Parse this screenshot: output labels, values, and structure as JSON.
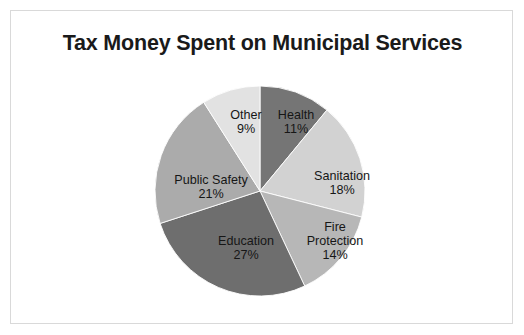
{
  "slide": {
    "background_color": "#ffffff",
    "border_color": "#d9d9d9"
  },
  "chart_data": {
    "type": "pie",
    "title": "Tax Money Spent on Municipal Services",
    "xlabel": "",
    "ylabel": "",
    "legend_position": "none",
    "grid": false,
    "units": "percent",
    "total": 100,
    "start_angle_deg": 0,
    "direction": "clockwise",
    "categories": [
      "Health",
      "Sanitation",
      "Fire Protection",
      "Education",
      "Public Safety",
      "Other"
    ],
    "values": [
      11,
      18,
      14,
      27,
      21,
      9
    ],
    "value_labels": [
      "11%",
      "18%",
      "14%",
      "27%",
      "21%",
      "9%"
    ],
    "colors": [
      "#757575",
      "#d2d2d2",
      "#b7b7b7",
      "#6e6e6e",
      "#ababab",
      "#e2e2e2"
    ],
    "slices": [
      {
        "name": "Health",
        "label_lines": [
          "Health",
          "11%"
        ],
        "value": 11,
        "value_label": "11%",
        "color": "#757575",
        "label_x": 285,
        "label_y": 111
      },
      {
        "name": "Sanitation",
        "label_lines": [
          "Sanitation",
          "18%"
        ],
        "value": 18,
        "value_label": "18%",
        "color": "#d2d2d2",
        "label_x": 331,
        "label_y": 172
      },
      {
        "name": "Fire Protection",
        "label_lines": [
          "Fire",
          "Protection",
          "14%"
        ],
        "value": 14,
        "value_label": "14%",
        "color": "#b7b7b7",
        "label_x": 324,
        "label_y": 230
      },
      {
        "name": "Education",
        "label_lines": [
          "Education",
          "27%"
        ],
        "value": 27,
        "value_label": "27%",
        "color": "#6e6e6e",
        "label_x": 235,
        "label_y": 237
      },
      {
        "name": "Public Safety",
        "label_lines": [
          "Public Safety",
          "21%"
        ],
        "value": 21,
        "value_label": "21%",
        "color": "#ababab",
        "label_x": 200,
        "label_y": 176
      },
      {
        "name": "Other",
        "label_lines": [
          "Other",
          "9%"
        ],
        "value": 9,
        "value_label": "9%",
        "color": "#e2e2e2",
        "label_x": 235,
        "label_y": 111
      }
    ],
    "geometry": {
      "center_x": 259,
      "center_y": 190,
      "radius": 96
    }
  }
}
